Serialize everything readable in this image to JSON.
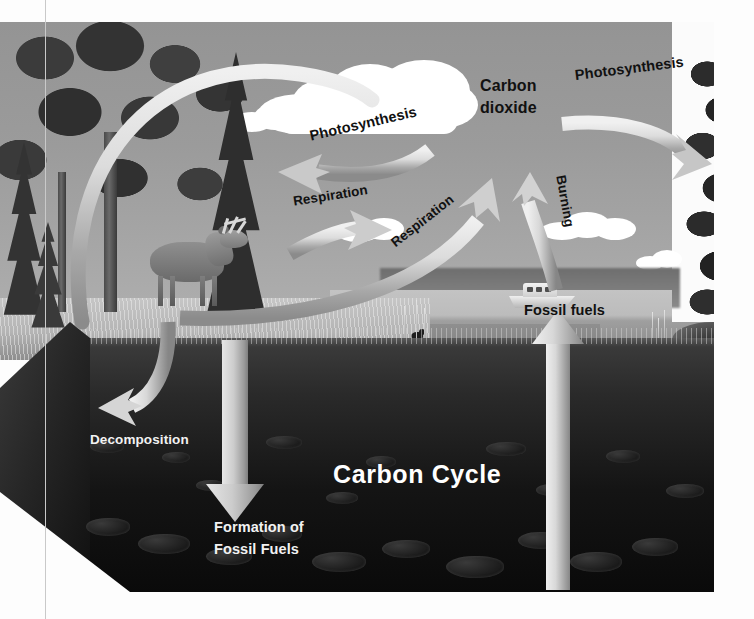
{
  "diagram": {
    "title": "Carbon Cycle",
    "type": "carbon-cycle-illustration",
    "labels": {
      "photosynthesis_left": "Photosynthesis",
      "photosynthesis_right": "Photosynthesis",
      "carbon_dioxide": "Carbon\ndioxide",
      "carbon_dioxide_line1": "Carbon",
      "carbon_dioxide_line2": "dioxide",
      "respiration_left": "Respiration",
      "respiration_right": "Respiration",
      "burning": "Burning",
      "fossil_fuels_lake": "Fossil fuels",
      "decomposition": "Decomposition",
      "formation_line1": "Formation of",
      "formation_line2": "Fossil Fuels"
    },
    "scene_elements": {
      "deer": "deer",
      "boat": "motorboat",
      "bird": "bird",
      "clouds": "clouds",
      "conifer_trees": "conifer trees",
      "deciduous_trees": "deciduous trees",
      "lake": "lake",
      "grass": "grass",
      "underground_soil": "underground soil cross-section",
      "rocks": "rocks"
    },
    "colors": {
      "sky": "#9b9b9b",
      "water": "#bcbcbc",
      "grass": "#b4b4b4",
      "soil_dark": "#141414",
      "arrow_light": "#e9e9e9",
      "arrow_shade": "#8f8f8f",
      "label_dark": "#111111",
      "label_light": "#f2f2f2",
      "page_background": "#fdfdfd"
    },
    "arrows": [
      {
        "name": "plants-to-soil-arc",
        "from": "forest canopy",
        "to": "underground",
        "style": "large-arc"
      },
      {
        "name": "photosynthesis-left",
        "from": "atmosphere",
        "to": "forest",
        "style": "curved"
      },
      {
        "name": "respiration-left",
        "from": "forest floor",
        "to": "atmosphere",
        "style": "curved"
      },
      {
        "name": "respiration-right",
        "from": "ground",
        "to": "atmosphere",
        "style": "curved"
      },
      {
        "name": "burning",
        "from": "fossil fuels",
        "to": "atmosphere",
        "style": "curved"
      },
      {
        "name": "photosynthesis-right",
        "from": "atmosphere",
        "to": "tree at right",
        "style": "curved"
      },
      {
        "name": "decomposition",
        "from": "surface",
        "to": "soil",
        "style": "hooked"
      },
      {
        "name": "formation-of-fossil-fuels",
        "from": "soil surface",
        "to": "deep soil",
        "style": "straight-down"
      },
      {
        "name": "fossil-fuels-extraction",
        "from": "deep soil",
        "to": "lake surface",
        "style": "straight-up"
      }
    ]
  }
}
